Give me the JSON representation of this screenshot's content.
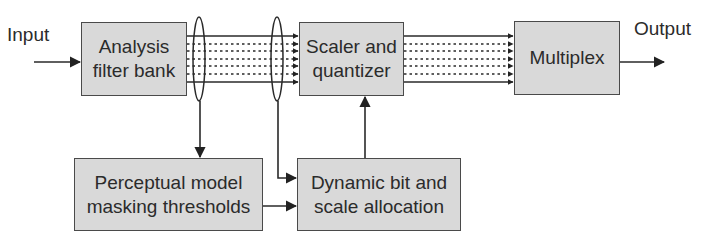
{
  "diagram": {
    "input_label": "Input",
    "output_label": "Output",
    "blocks": {
      "analysis": {
        "line1": "Analysis",
        "line2": "filter bank"
      },
      "scaler": {
        "line1": "Scaler and",
        "line2": "quantizer"
      },
      "multiplex": {
        "line1": "Multiplex"
      },
      "perceptual": {
        "line1": "Perceptual model",
        "line2": "masking thresholds"
      },
      "dynamic": {
        "line1": "Dynamic bit and",
        "line2": "scale allocation"
      }
    },
    "connections": [
      {
        "from": "input",
        "to": "analysis"
      },
      {
        "from": "analysis",
        "to": "scaler",
        "type": "subband-bus"
      },
      {
        "from": "scaler",
        "to": "multiplex",
        "type": "subband-bus"
      },
      {
        "from": "multiplex",
        "to": "output"
      },
      {
        "from": "analysis-bus-tap",
        "to": "perceptual"
      },
      {
        "from": "analysis-bus-tap",
        "to": "dynamic"
      },
      {
        "from": "perceptual",
        "to": "dynamic"
      },
      {
        "from": "dynamic",
        "to": "scaler"
      }
    ],
    "colors": {
      "block_fill": "#d9d9d9",
      "line": "#2a2a2a",
      "background": "#ffffff"
    }
  }
}
